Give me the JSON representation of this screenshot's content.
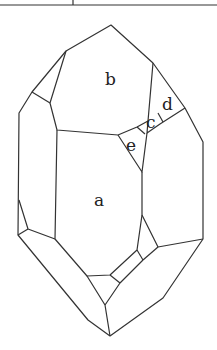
{
  "diagram": {
    "title": "",
    "type": "crystal face diagram",
    "face_labels": {
      "a": "a",
      "b": "b",
      "c": "c",
      "d": "d",
      "e": "e"
    },
    "stroke_color": "#333333",
    "background": "#ffffff"
  }
}
